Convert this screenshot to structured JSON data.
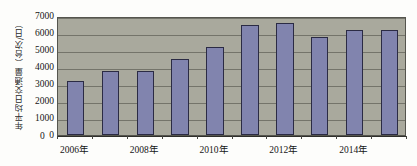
{
  "chart_data": {
    "type": "bar",
    "title": "",
    "subtitle": "",
    "xlabel": "",
    "ylabel": "年平均日交通量（台次/日）",
    "ylim": [
      0,
      7000
    ],
    "ytick_labels": [
      "7000",
      "6000",
      "5000",
      "4000",
      "3000",
      "2000",
      "1000",
      "0"
    ],
    "ytick_values": [
      7000,
      6000,
      5000,
      4000,
      3000,
      2000,
      1000,
      0
    ],
    "grid": true,
    "legend": "none",
    "categories": [
      "2006",
      "2007",
      "2008",
      "2009",
      "2010",
      "2011",
      "2012",
      "2013",
      "2014",
      "2015"
    ],
    "xtick_labels": [
      "2006年",
      "",
      "2008年",
      "",
      "2010年",
      "",
      "2012年",
      "",
      "2014年",
      ""
    ],
    "xtick_labels_visible": [
      "2006年",
      "2008年",
      "2010年",
      "2012年",
      "2014年"
    ],
    "values": [
      3200,
      3750,
      3750,
      4500,
      5200,
      6500,
      6600,
      5750,
      6200,
      6200
    ],
    "series": [
      {
        "name": "年平均日交通量",
        "values": [
          3200,
          3750,
          3750,
          4500,
          5200,
          6500,
          6600,
          5750,
          6200,
          6200
        ]
      }
    ],
    "colors": {
      "bar_fill": "#8184ae",
      "bar_outline": "#2b2b44",
      "plot_background": "#a9a99d",
      "gridline": "#6b6b61",
      "axis": "#2f2f2b",
      "text": "#151515",
      "page_background": "#fdfdfb"
    }
  }
}
